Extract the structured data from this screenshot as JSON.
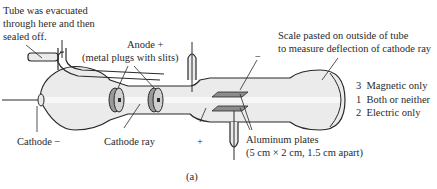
{
  "labels": {
    "evacuated": [
      "Tube was evacuated",
      "through here and then",
      "sealed off."
    ],
    "anode": [
      "Anode +",
      "(metal plugs with slits)"
    ],
    "scale": [
      "Scale pasted on outside of tube",
      "to measure deflection of cathode ray"
    ],
    "cathode": "Cathode −",
    "cathode_ray": "Cathode ray",
    "plate_plus": "+",
    "plate_minus": "−",
    "aluminum": [
      "Aluminum plates",
      "(5 cm × 2 cm, 1.5 cm apart)"
    ],
    "deflection": [
      {
        "num": "3",
        "text": "Magnetic only"
      },
      {
        "num": "1",
        "text": "Both or neither"
      },
      {
        "num": "2",
        "text": "Electric only"
      }
    ],
    "caption": "(a)"
  },
  "colors": {
    "tube_fill": "#ebebeb",
    "outline": "#2a2a2a",
    "anode_fill": "#9a9a9a",
    "plate_fill": "#8c8c8c",
    "text": "#2a2a2a"
  }
}
